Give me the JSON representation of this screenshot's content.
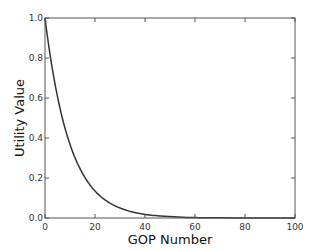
{
  "chart_data": {
    "type": "line",
    "title": "",
    "xlabel": "GOP Number",
    "ylabel": "Utility Value",
    "xlim": [
      0,
      100
    ],
    "ylim": [
      0.0,
      1.0
    ],
    "grid": false,
    "legend": null,
    "xticks": [
      0,
      20,
      40,
      60,
      80,
      100
    ],
    "xtick_labels": [
      "0",
      "20",
      "40",
      "60",
      "80",
      "100"
    ],
    "yticks": [
      0.0,
      0.2,
      0.4,
      0.6,
      0.8,
      1.0
    ],
    "ytick_labels": [
      "0.0",
      "0.2",
      "0.4",
      "0.6",
      "0.8",
      "1.0"
    ],
    "series": [
      {
        "name": "Utility",
        "color": "#333333",
        "x": [
          0,
          2,
          4,
          6,
          8,
          10,
          12,
          14,
          16,
          18,
          20,
          25,
          30,
          35,
          40,
          45,
          50,
          60,
          70,
          80,
          90,
          100
        ],
        "y": [
          1.0,
          0.819,
          0.67,
          0.549,
          0.449,
          0.368,
          0.301,
          0.247,
          0.202,
          0.165,
          0.135,
          0.082,
          0.05,
          0.03,
          0.018,
          0.011,
          0.007,
          0.002,
          0.001,
          0.0,
          0.0,
          0.0
        ]
      }
    ]
  }
}
